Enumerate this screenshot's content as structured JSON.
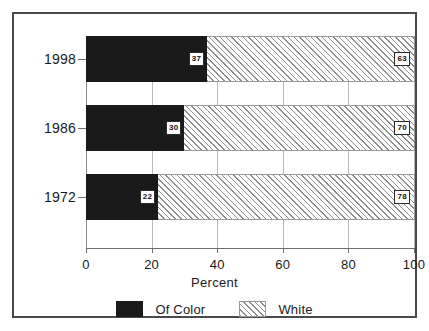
{
  "chart_data": {
    "type": "bar",
    "orientation": "horizontal",
    "stacked": true,
    "title": "",
    "xlabel": "Percent",
    "ylabel": "",
    "xlim": [
      0,
      100
    ],
    "xticks": [
      0,
      20,
      40,
      60,
      80,
      100
    ],
    "xtick_labels": [
      "0",
      "20",
      "40",
      "60",
      "80",
      "100"
    ],
    "grid": true,
    "grid_axis": "x",
    "legend_position": "bottom",
    "categories": [
      "1998",
      "1986",
      "1972"
    ],
    "series": [
      {
        "name": "Of Color",
        "color": "#1a1a1a",
        "pattern": "solid",
        "values": [
          37,
          30,
          22
        ],
        "labels": [
          "37",
          "30",
          "22"
        ]
      },
      {
        "name": "White",
        "color": "#ffffff",
        "pattern": "diagonal-hatch",
        "values": [
          63,
          70,
          78
        ],
        "labels": [
          "63",
          "70",
          "78"
        ]
      }
    ]
  },
  "axis": {
    "x_title": "Percent",
    "ticks": [
      {
        "label": "0",
        "value": 0
      },
      {
        "label": "20",
        "value": 20
      },
      {
        "label": "40",
        "value": 40
      },
      {
        "label": "60",
        "value": 60
      },
      {
        "label": "80",
        "value": 80
      },
      {
        "label": "100",
        "value": 100
      }
    ]
  },
  "rows": [
    {
      "year": "1998",
      "dark_value": 37,
      "dark_label": "37",
      "hatch_value": 63,
      "hatch_label": "63"
    },
    {
      "year": "1986",
      "dark_value": 30,
      "dark_label": "30",
      "hatch_value": 70,
      "hatch_label": "70"
    },
    {
      "year": "1972",
      "dark_value": 22,
      "dark_label": "22",
      "hatch_value": 78,
      "hatch_label": "78"
    }
  ],
  "legend": {
    "items": [
      {
        "label": "Of Color",
        "swatch": "solid-black-swatch"
      },
      {
        "label": "White",
        "swatch": "hatched-swatch"
      }
    ]
  }
}
